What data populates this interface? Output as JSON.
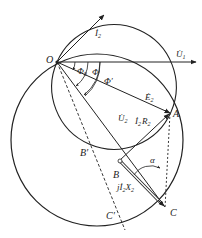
{
  "diagram": {
    "type": "phasor-circle-diagram",
    "colors": {
      "stroke": "#222222",
      "background": "#ffffff"
    },
    "points": {
      "O": {
        "label": "O",
        "x": 57,
        "y": 62
      },
      "A": {
        "label": "A",
        "x": 170,
        "y": 113
      },
      "B": {
        "label": "B",
        "x": 119,
        "y": 163
      },
      "C": {
        "label": "C",
        "x": 165,
        "y": 208
      },
      "B_prime": {
        "label": "B′",
        "x": 92,
        "y": 145
      },
      "C_prime": {
        "label": "C′",
        "x": 122,
        "y": 218
      }
    },
    "vectors": {
      "I2": {
        "label": "İ",
        "sub": "2"
      },
      "U1": {
        "label": "U̇",
        "sub": "1"
      },
      "E2": {
        "label": "Ė",
        "sub": "2"
      },
      "U2": {
        "label": "U̇",
        "sub": "2"
      },
      "I2R2": {
        "label": "İ",
        "sub": "2",
        "tail": "R",
        "tail_sub": "2"
      },
      "jI2X2": {
        "prefix": "j",
        "label": "İ",
        "sub": "2",
        "tail": "X",
        "tail_sub": "2"
      }
    },
    "angles": {
      "phi0": {
        "label": "Φ",
        "sub": "0"
      },
      "phi": {
        "label": "Φ"
      },
      "phi_prime": {
        "label": "Φ′"
      },
      "alpha": {
        "label": "α"
      }
    }
  }
}
